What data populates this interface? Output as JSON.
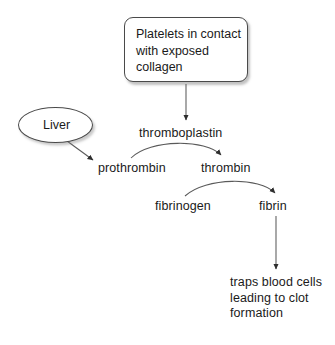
{
  "diagram": {
    "style": {
      "background": "#ffffff",
      "text_color": "#1a1a1a",
      "stroke_color": "#4a4a4a",
      "arrow_color": "#3a3a3a"
    },
    "nodes": {
      "platelet_box": {
        "shape": "rounded-rectangle",
        "label": "Platelets in contact with exposed collagen",
        "lines": [
          "Platelets in",
          "contact with",
          "exposed collagen"
        ]
      },
      "liver": {
        "shape": "ellipse",
        "label": "Liver"
      },
      "thromboplastin": {
        "shape": "text",
        "label": "thromboplastin"
      },
      "prothrombin": {
        "shape": "text",
        "label": "prothrombin"
      },
      "thrombin": {
        "shape": "text",
        "label": "thrombin"
      },
      "fibrinogen": {
        "shape": "text",
        "label": "fibrinogen"
      },
      "fibrin": {
        "shape": "text",
        "label": "fibrin"
      },
      "clot_outcome": {
        "shape": "text",
        "label": "traps blood cells leading to clot formation",
        "lines": [
          "traps blood cells",
          "leading to clot",
          "formation"
        ]
      }
    },
    "edges": [
      {
        "id": "box-to-thromboplastin",
        "from": "platelet_box",
        "to": "thromboplastin",
        "kind": "straight-vertical"
      },
      {
        "id": "liver-to-prothrombin",
        "from": "liver",
        "to": "prothrombin",
        "kind": "straight-diagonal"
      },
      {
        "id": "prothrombin-to-thrombin",
        "from": "prothrombin",
        "to": "thrombin",
        "kind": "curved-arc"
      },
      {
        "id": "fibrinogen-to-fibrin",
        "from": "fibrinogen",
        "to": "fibrin",
        "kind": "curved-arc"
      },
      {
        "id": "fibrin-to-clot",
        "from": "fibrin",
        "to": "clot_outcome",
        "kind": "straight-vertical"
      }
    ]
  }
}
